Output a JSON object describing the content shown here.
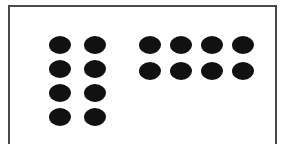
{
  "figure": {
    "kind": "dot-array-comparison",
    "background_color": "#ffffff",
    "border_color": "#4a4a4a",
    "dot_color": "#111111",
    "total_dots": 16
  },
  "chart_data": {
    "type": "scatter",
    "title": "",
    "xlabel": "",
    "ylabel": "",
    "grid": false,
    "legend": "none",
    "groups": [
      {
        "name": "left-array",
        "rows": 4,
        "columns": 2,
        "count": 8,
        "arrangement": "2 x 4"
      },
      {
        "name": "right-array",
        "rows": 2,
        "columns": 4,
        "count": 8,
        "arrangement": "4 x 2"
      }
    ],
    "categories": [
      "left-array",
      "right-array"
    ],
    "values": [
      8,
      8
    ]
  },
  "groups": {
    "left": {
      "label": "left-array",
      "count": 8,
      "rows": [
        [
          "dot",
          "dot"
        ],
        [
          "dot",
          "dot"
        ],
        [
          "dot",
          "dot"
        ],
        [
          "dot",
          "dot"
        ]
      ]
    },
    "right": {
      "label": "right-array",
      "count": 8,
      "rows": [
        [
          "dot",
          "dot",
          "dot",
          "dot"
        ],
        [
          "dot",
          "dot",
          "dot",
          "dot"
        ]
      ]
    }
  }
}
